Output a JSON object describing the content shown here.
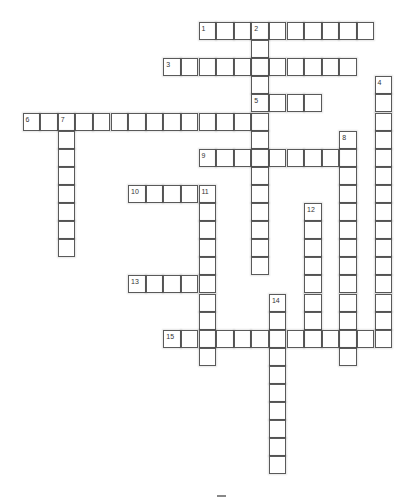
{
  "puzzle": {
    "type": "crossword",
    "grid": {
      "origin_x": 22.5,
      "origin_y": 22,
      "cell_w": 17.6,
      "cell_h": 18.1
    },
    "entries": [
      {
        "number": "1",
        "direction": "across",
        "row": 0,
        "col": 10,
        "length": 10
      },
      {
        "number": "2",
        "direction": "down",
        "row": 0,
        "col": 13,
        "length": 14
      },
      {
        "number": "3",
        "direction": "across",
        "row": 2,
        "col": 8,
        "length": 11
      },
      {
        "number": "4",
        "direction": "down",
        "row": 3,
        "col": 20,
        "length": 15
      },
      {
        "number": "5",
        "direction": "across",
        "row": 4,
        "col": 13,
        "length": 4
      },
      {
        "number": "6",
        "direction": "across",
        "row": 5,
        "col": 0,
        "length": 14
      },
      {
        "number": "7",
        "direction": "down",
        "row": 5,
        "col": 2,
        "length": 8
      },
      {
        "number": "8",
        "direction": "down",
        "row": 6,
        "col": 18,
        "length": 13
      },
      {
        "number": "9",
        "direction": "across",
        "row": 7,
        "col": 10,
        "length": 9
      },
      {
        "number": "10",
        "direction": "across",
        "row": 9,
        "col": 6,
        "length": 5
      },
      {
        "number": "11",
        "direction": "down",
        "row": 9,
        "col": 10,
        "length": 10
      },
      {
        "number": "12",
        "direction": "down",
        "row": 10,
        "col": 16,
        "length": 8
      },
      {
        "number": "13",
        "direction": "across",
        "row": 14,
        "col": 6,
        "length": 5
      },
      {
        "number": "14",
        "direction": "down",
        "row": 15,
        "col": 14,
        "length": 10
      },
      {
        "number": "15",
        "direction": "across",
        "row": 17,
        "col": 8,
        "length": 13
      }
    ]
  }
}
